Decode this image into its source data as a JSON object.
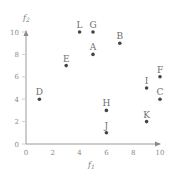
{
  "chart_data": {
    "type": "scatter",
    "title": "",
    "xlabel": "f1",
    "ylabel": "f2",
    "xlim": [
      0,
      10
    ],
    "ylim": [
      0,
      10
    ],
    "x_ticks": [
      0,
      2,
      4,
      6,
      8,
      10
    ],
    "y_ticks": [
      0,
      2,
      4,
      6,
      8,
      10
    ],
    "grid": false,
    "legend": null,
    "points": [
      {
        "label": "A",
        "x": 5,
        "y": 8
      },
      {
        "label": "B",
        "x": 7,
        "y": 9
      },
      {
        "label": "C",
        "x": 10,
        "y": 4
      },
      {
        "label": "D",
        "x": 1,
        "y": 4
      },
      {
        "label": "E",
        "x": 3,
        "y": 7
      },
      {
        "label": "F",
        "x": 10,
        "y": 6
      },
      {
        "label": "G",
        "x": 5,
        "y": 10
      },
      {
        "label": "H",
        "x": 6,
        "y": 3
      },
      {
        "label": "I",
        "x": 9,
        "y": 5
      },
      {
        "label": "J",
        "x": 6,
        "y": 1
      },
      {
        "label": "K",
        "x": 9,
        "y": 2
      },
      {
        "label": "L",
        "x": 4,
        "y": 10
      }
    ]
  },
  "labels": {
    "xlabel_main": "f",
    "xlabel_sub": "1",
    "ylabel_main": "f",
    "ylabel_sub": "2"
  },
  "colors": {
    "axis": "#9a9a9a",
    "point": "#444444",
    "text": "#6f6f6f"
  }
}
